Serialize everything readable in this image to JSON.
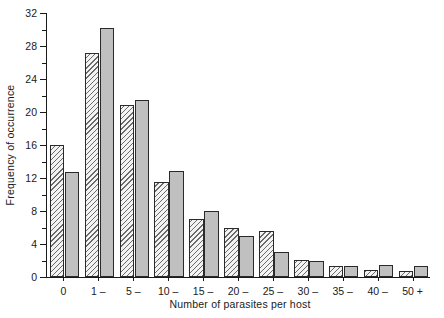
{
  "figure": {
    "background_color": "#ffffff",
    "axis_color": "#1a1a1a"
  },
  "chart_data": {
    "type": "bar",
    "title": "",
    "xlabel": "Number of parasites per host",
    "ylabel": "Frequency of occurrence",
    "categories": [
      "0",
      "1 –",
      "5 –",
      "10 –",
      "15 –",
      "20 –",
      "25 –",
      "30 –",
      "35 –",
      "40 –",
      "50 +"
    ],
    "series": [
      {
        "name": "hatched",
        "fill": "diagonal-hatch",
        "color": "#f3f3f3",
        "values": [
          16,
          27.2,
          20.8,
          11.5,
          7,
          6,
          5.6,
          2.1,
          1.3,
          0.9,
          0.7
        ]
      },
      {
        "name": "solid",
        "fill": "solid-grey",
        "color": "#c0c0c0",
        "values": [
          12.7,
          30.2,
          21.4,
          12.8,
          8,
          5,
          3,
          2,
          1.3,
          1.5,
          1.3
        ]
      }
    ],
    "ylim": [
      0,
      32
    ],
    "y_major_ticks": [
      0,
      4,
      8,
      12,
      16,
      20,
      24,
      28,
      32
    ],
    "y_tick_labels": [
      "0",
      "4",
      "8",
      "12",
      "16",
      "20",
      "24",
      "28",
      "32"
    ],
    "y_minor_ticks": [
      2,
      6,
      10,
      14,
      18,
      22,
      26,
      30
    ],
    "grid": false,
    "legend": "none"
  }
}
